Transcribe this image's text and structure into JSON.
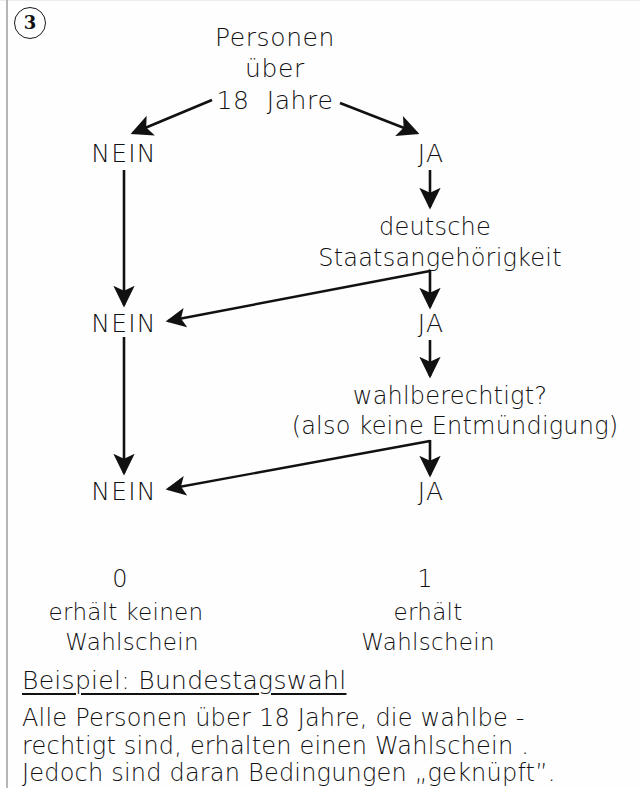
{
  "sheet": {
    "item_number": "3"
  },
  "flow": {
    "root_question": {
      "line1": "Personen",
      "line2": "über",
      "line3": "18  Jahre"
    },
    "level1": {
      "no_label": "NEIN",
      "yes_label": "JA"
    },
    "question2": {
      "line1": "deutsche",
      "line2": "Staatsangehörigkeit"
    },
    "level2": {
      "no_label": "NEIN",
      "yes_label": "JA"
    },
    "question3": {
      "line1": "wahlberechtigt?",
      "line2": "(also keine Entmündigung)"
    },
    "level3": {
      "no_label": "NEIN",
      "yes_label": "JA"
    }
  },
  "outcomes": {
    "no": {
      "value": "0",
      "line1": "erhält keinen",
      "line2": "Wahlschein"
    },
    "yes": {
      "value": "1",
      "line1": "erhält",
      "line2": "Wahlschein"
    }
  },
  "example": {
    "heading": "Beispiel: Bundestagswahl",
    "line1": "Alle Personen über 18 Jahre, die wahlbe -",
    "line2": "rechtigt sind, erhalten einen Wahlschein .",
    "line3": "Jedoch sind daran Bedingungen „geknüpft”."
  },
  "colors": {
    "ink": "#111111",
    "paper": "#fefefe",
    "scan_edge": "#9a9a9a"
  }
}
